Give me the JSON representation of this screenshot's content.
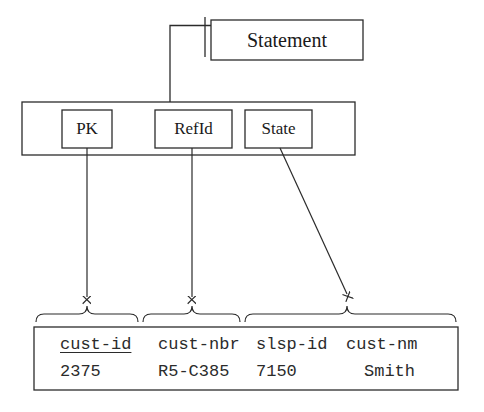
{
  "diagram": {
    "title_entity": "Statement",
    "container": {
      "name": "key-container",
      "keys": [
        {
          "label": "PK",
          "name": "primary-key"
        },
        {
          "label": "RefId",
          "name": "reference-id"
        },
        {
          "label": "State",
          "name": "state"
        }
      ]
    },
    "record": {
      "columns": [
        {
          "header": "cust-id",
          "value": "2375",
          "underlined": true
        },
        {
          "header": "cust-nbr",
          "value": "R5-C385",
          "underlined": false
        },
        {
          "header": "slsp-id",
          "value": "7150",
          "underlined": false
        },
        {
          "header": "cust-nm",
          "value": "Smith",
          "underlined": false
        }
      ]
    },
    "connectors": [
      {
        "name": "statement-to-container",
        "from": "Statement",
        "to": "key-container",
        "style": "elbow-with-tick"
      },
      {
        "name": "pk-to-cust-id",
        "from": "PK",
        "to": "cust-id",
        "style": "vertical-arrow"
      },
      {
        "name": "refid-to-cust-nbr",
        "from": "RefId",
        "to": "cust-nbr",
        "style": "vertical-arrow"
      },
      {
        "name": "state-to-cust-nm",
        "from": "State",
        "to": "cust-nm",
        "style": "diagonal-arrow"
      }
    ],
    "braces": [
      {
        "name": "brace-group-1",
        "spans": "cust-id"
      },
      {
        "name": "brace-group-2",
        "spans": "cust-nbr"
      },
      {
        "name": "brace-group-3",
        "spans": "slsp-id cust-nm"
      }
    ],
    "colors": {
      "stroke": "#2b2b2b",
      "text": "#1a1a1a",
      "background": "#ffffff"
    }
  }
}
